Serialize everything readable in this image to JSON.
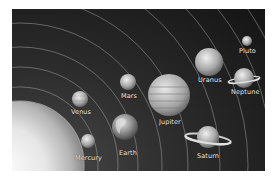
{
  "image": {
    "subject": "Solar system illustration",
    "background_color": "#1e1e1e",
    "sun": {
      "label": ""
    },
    "planets": [
      {
        "name": "Mercury",
        "label": "Mercury"
      },
      {
        "name": "Venus",
        "label": "Venus"
      },
      {
        "name": "Earth",
        "label": "Earth"
      },
      {
        "name": "Mars",
        "label": "Mars"
      },
      {
        "name": "Jupiter",
        "label": "Jupiter"
      },
      {
        "name": "Saturn",
        "label": "Saturn"
      },
      {
        "name": "Uranus",
        "label": "Uranus"
      },
      {
        "name": "Neptune",
        "label": "Neptune"
      },
      {
        "name": "Pluto",
        "label": "Pluto"
      }
    ]
  }
}
